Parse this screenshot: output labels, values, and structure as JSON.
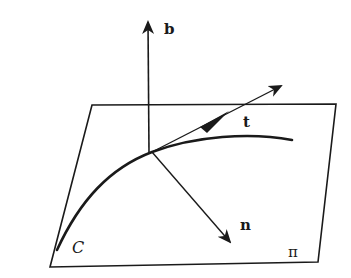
{
  "diagram": {
    "labels": {
      "binormal": "b",
      "tangent": "t",
      "normal": "n",
      "curve": "C",
      "plane": "π"
    },
    "colors": {
      "ink": "#1a1a1a",
      "background": "#ffffff"
    }
  }
}
